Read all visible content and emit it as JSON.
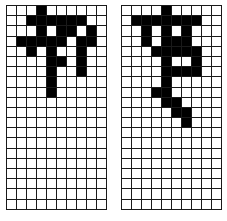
{
  "figure": {
    "grid_rows": 20,
    "grid_cols": 10,
    "filled_color": "#000000",
    "empty_color": "#ffffff",
    "line_color": "#1a1a1a",
    "panels": [
      {
        "id": "left",
        "filled": [
          [
            0,
            3
          ],
          [
            1,
            2
          ],
          [
            1,
            3
          ],
          [
            1,
            4
          ],
          [
            1,
            5
          ],
          [
            1,
            6
          ],
          [
            1,
            7
          ],
          [
            2,
            3
          ],
          [
            2,
            5
          ],
          [
            2,
            6
          ],
          [
            2,
            8
          ],
          [
            3,
            1
          ],
          [
            3,
            2
          ],
          [
            3,
            3
          ],
          [
            3,
            4
          ],
          [
            3,
            5
          ],
          [
            3,
            7
          ],
          [
            3,
            8
          ],
          [
            4,
            2
          ],
          [
            4,
            4
          ],
          [
            4,
            7
          ],
          [
            5,
            4
          ],
          [
            5,
            5
          ],
          [
            5,
            7
          ],
          [
            6,
            4
          ],
          [
            6,
            7
          ],
          [
            7,
            4
          ],
          [
            8,
            4
          ]
        ]
      },
      {
        "id": "right",
        "filled": [
          [
            0,
            4
          ],
          [
            1,
            1
          ],
          [
            1,
            2
          ],
          [
            1,
            3
          ],
          [
            1,
            4
          ],
          [
            1,
            5
          ],
          [
            1,
            6
          ],
          [
            1,
            7
          ],
          [
            2,
            2
          ],
          [
            2,
            4
          ],
          [
            2,
            6
          ],
          [
            3,
            2
          ],
          [
            3,
            4
          ],
          [
            3,
            5
          ],
          [
            3,
            6
          ],
          [
            4,
            3
          ],
          [
            4,
            4
          ],
          [
            4,
            5
          ],
          [
            4,
            6
          ],
          [
            4,
            7
          ],
          [
            5,
            4
          ],
          [
            5,
            7
          ],
          [
            6,
            4
          ],
          [
            6,
            5
          ],
          [
            6,
            6
          ],
          [
            6,
            7
          ],
          [
            7,
            4
          ],
          [
            8,
            3
          ],
          [
            8,
            4
          ],
          [
            9,
            4
          ],
          [
            9,
            5
          ],
          [
            10,
            5
          ],
          [
            10,
            6
          ],
          [
            11,
            6
          ]
        ]
      }
    ]
  }
}
